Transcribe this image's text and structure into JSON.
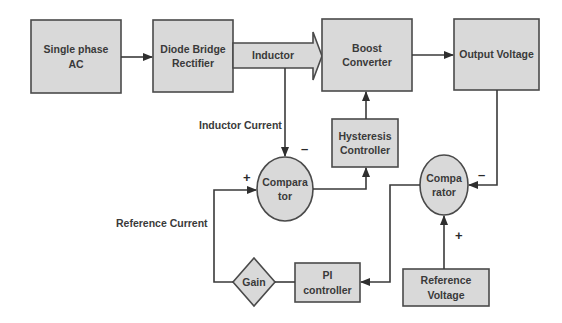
{
  "diagram": {
    "colors": {
      "block_fill": "#d9d9d9",
      "block_stroke": "#4a4a4a",
      "line": "#3a3a3a",
      "text": "#3a3a3a",
      "background": "#ffffff"
    },
    "blocks": {
      "single_phase_ac": "Single phase\nAC",
      "diode_bridge": "Diode Bridge\nRectifier",
      "inductor": "Inductor",
      "boost_converter": "Boost\nConverter",
      "output_voltage": "Output Voltage",
      "hysteresis_controller": "Hysteresis\nController",
      "comparator_current": "Compara\ntor",
      "comparator_voltage": "Compa\nrator",
      "gain": "Gain",
      "pi_controller": "PI\ncontroller",
      "reference_voltage": "Reference\nVoltage"
    },
    "labels": {
      "inductor_current": "Inductor Current",
      "reference_current": "Reference Current"
    },
    "signs": {
      "comp1_minus": "–",
      "comp1_plus": "+",
      "comp2_minus": "–",
      "comp2_plus": "+"
    },
    "connections": [
      {
        "from": "Single phase AC",
        "to": "Diode Bridge Rectifier"
      },
      {
        "from": "Diode Bridge Rectifier",
        "to": "Boost Converter",
        "via": "Inductor"
      },
      {
        "from": "Boost Converter",
        "to": "Output Voltage"
      },
      {
        "from": "Inductor",
        "to": "Comparator (current)",
        "label": "Inductor Current",
        "sign": "-"
      },
      {
        "from": "Comparator (current)",
        "to": "Hysteresis Controller"
      },
      {
        "from": "Hysteresis Controller",
        "to": "Boost Converter"
      },
      {
        "from": "Output Voltage",
        "to": "Comparator (voltage)",
        "sign": "-"
      },
      {
        "from": "Reference Voltage",
        "to": "Comparator (voltage)",
        "sign": "+"
      },
      {
        "from": "Comparator (voltage)",
        "to": "PI controller"
      },
      {
        "from": "PI controller",
        "to": "Gain"
      },
      {
        "from": "Gain",
        "to": "Comparator (current)",
        "label": "Reference Current",
        "sign": "+"
      }
    ]
  }
}
